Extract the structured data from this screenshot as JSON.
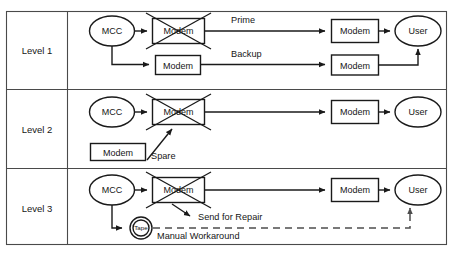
{
  "diagram": {
    "type": "flow-diagram",
    "colors": {
      "background": "#ffffff",
      "frame": "#4a4a4a",
      "node_stroke": "#1a1a1a",
      "connector": "#1a1a1a",
      "dashed_connector": "#4d4d4d",
      "text": "#161616"
    },
    "rows": [
      {
        "level_label": "Level 1",
        "nodes": [
          {
            "id": "l1-mcc",
            "name": "mcc-node",
            "shape": "ellipse",
            "label": "MCC"
          },
          {
            "id": "l1-modem-failed",
            "name": "failed-modem-node",
            "shape": "rect",
            "label": "Modem",
            "failed": true
          },
          {
            "id": "l1-modem-backup",
            "name": "backup-modem-node",
            "shape": "rect",
            "label": "Modem",
            "failed": false
          },
          {
            "id": "l1-modem-prime-right",
            "name": "prime-receiving-modem-node",
            "shape": "rect",
            "label": "Modem",
            "failed": false
          },
          {
            "id": "l1-modem-backup-right",
            "name": "backup-receiving-modem-node",
            "shape": "rect",
            "label": "Modem",
            "failed": false
          },
          {
            "id": "l1-user",
            "name": "user-node",
            "shape": "ellipse",
            "label": "User"
          }
        ],
        "edge_labels": [
          {
            "name": "prime-path-label",
            "text": "Prime"
          },
          {
            "name": "backup-path-label",
            "text": "Backup"
          }
        ]
      },
      {
        "level_label": "Level 2",
        "nodes": [
          {
            "id": "l2-mcc",
            "name": "mcc-node",
            "shape": "ellipse",
            "label": "MCC"
          },
          {
            "id": "l2-modem-failed",
            "name": "failed-modem-node",
            "shape": "rect",
            "label": "Modem",
            "failed": true
          },
          {
            "id": "l2-modem-spare",
            "name": "spare-modem-node",
            "shape": "rect",
            "label": "Modem",
            "failed": false
          },
          {
            "id": "l2-modem-right",
            "name": "receiving-modem-node",
            "shape": "rect",
            "label": "Modem",
            "failed": false
          },
          {
            "id": "l2-user",
            "name": "user-node",
            "shape": "ellipse",
            "label": "User"
          }
        ],
        "edge_labels": [
          {
            "name": "spare-label",
            "text": "Spare"
          }
        ]
      },
      {
        "level_label": "Level 3",
        "nodes": [
          {
            "id": "l3-mcc",
            "name": "mcc-node",
            "shape": "ellipse",
            "label": "MCC"
          },
          {
            "id": "l3-modem-failed",
            "name": "failed-modem-node",
            "shape": "rect",
            "label": "Modem",
            "failed": true
          },
          {
            "id": "l3-tape",
            "name": "tape-node",
            "shape": "double-circle",
            "label": "Tape"
          },
          {
            "id": "l3-modem-right",
            "name": "receiving-modem-node",
            "shape": "rect",
            "label": "Modem",
            "failed": false
          },
          {
            "id": "l3-user",
            "name": "user-node",
            "shape": "ellipse",
            "label": "User"
          }
        ],
        "edge_labels": [
          {
            "name": "send-for-repair-label",
            "text": "Send for Repair"
          },
          {
            "name": "manual-workaround-label",
            "text": "Manual Workaround"
          }
        ]
      }
    ]
  }
}
